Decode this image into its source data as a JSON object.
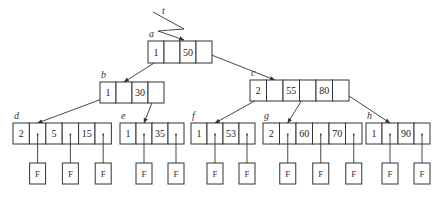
{
  "diagram": {
    "type": "b-tree",
    "pointer_label": "t",
    "failure_label": "F",
    "nodes": [
      {
        "id": "a",
        "label": "a",
        "n": "1",
        "keys": [
          "50"
        ]
      },
      {
        "id": "b",
        "label": "b",
        "n": "1",
        "keys": [
          "30"
        ]
      },
      {
        "id": "c",
        "label": "c",
        "n": "2",
        "keys": [
          "55",
          "80"
        ]
      },
      {
        "id": "d",
        "label": "d",
        "n": "2",
        "keys": [
          "5",
          "15"
        ]
      },
      {
        "id": "e",
        "label": "e",
        "n": "1",
        "keys": [
          "35"
        ]
      },
      {
        "id": "f",
        "label": "f",
        "n": "1",
        "keys": [
          "53"
        ]
      },
      {
        "id": "g",
        "label": "g",
        "n": "2",
        "keys": [
          "60",
          "70"
        ]
      },
      {
        "id": "h",
        "label": "h",
        "n": "1",
        "keys": [
          "90"
        ]
      }
    ],
    "edges": [
      {
        "from": "t",
        "to": "a"
      },
      {
        "from": "a",
        "ptr": 0,
        "to": "b"
      },
      {
        "from": "a",
        "ptr": 1,
        "to": "c"
      },
      {
        "from": "b",
        "ptr": 0,
        "to": "d"
      },
      {
        "from": "b",
        "ptr": 1,
        "to": "e"
      },
      {
        "from": "c",
        "ptr": 0,
        "to": "f"
      },
      {
        "from": "c",
        "ptr": 1,
        "to": "g"
      },
      {
        "from": "c",
        "ptr": 2,
        "to": "h"
      }
    ]
  }
}
